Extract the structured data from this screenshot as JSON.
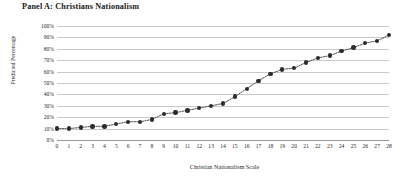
{
  "panel": {
    "title": "Panel A: Christians Nationalism"
  },
  "chart_data": {
    "type": "line",
    "title": "Panel A: Christians Nationalism",
    "xlabel": "Christian Nationalism Scale",
    "ylabel": "Predicted Percentage",
    "xlim": [
      0,
      28
    ],
    "ylim": [
      0,
      100
    ],
    "grid": true,
    "legend": null,
    "marker": "filled-circle",
    "line_style": "dotted",
    "x_tick_labels": [
      "0",
      "1",
      "2",
      "3",
      "4",
      "5",
      "6",
      "7",
      "8",
      "9",
      "10",
      "11",
      "12",
      "13",
      "14",
      "15",
      "16",
      "17",
      "18",
      "19",
      "20",
      "21",
      "22",
      "23",
      "24",
      "25",
      "26",
      "27",
      "28"
    ],
    "y_tick_labels": [
      "0%",
      "10%",
      "20%",
      "30%",
      "40%",
      "50%",
      "60%",
      "70%",
      "80%",
      "90%",
      "100%"
    ],
    "y_tick_values": [
      0,
      10,
      20,
      30,
      40,
      50,
      60,
      70,
      80,
      90,
      100
    ],
    "x": [
      0,
      1,
      2,
      3,
      4,
      5,
      6,
      7,
      8,
      9,
      10,
      11,
      12,
      13,
      14,
      15,
      16,
      17,
      18,
      19,
      20,
      21,
      22,
      23,
      24,
      25,
      26,
      27,
      28
    ],
    "values": [
      10,
      10,
      11,
      12,
      12,
      14,
      16,
      16,
      18,
      23,
      24,
      26,
      28,
      30,
      32,
      38,
      45,
      52,
      58,
      62,
      63,
      68,
      72,
      74,
      78,
      81,
      85,
      87,
      92
    ],
    "series": [
      {
        "name": "Predicted Percentage",
        "values": [
          10,
          10,
          11,
          12,
          12,
          14,
          16,
          16,
          18,
          23,
          24,
          26,
          28,
          30,
          32,
          38,
          45,
          52,
          58,
          62,
          63,
          68,
          72,
          74,
          78,
          81,
          85,
          87,
          92
        ]
      }
    ],
    "colors": {
      "marker": "#2c2c2c",
      "line": "#3a3a3a",
      "grid": "#c9c9c9",
      "axis": "#9a9a9a",
      "background": "#ffffff",
      "text": "#231f20"
    }
  }
}
